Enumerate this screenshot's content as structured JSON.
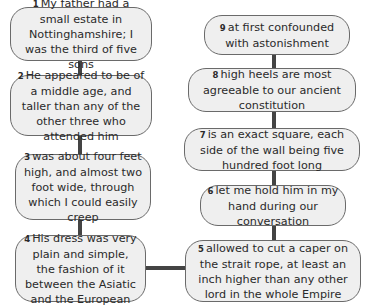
{
  "diagram": {
    "type": "flowchart",
    "colors": {
      "box_fill": "#efefef",
      "box_border": "#6a6a6a",
      "connector": "#444444",
      "text": "#2a2a2a"
    },
    "nodes": [
      {
        "num": "1",
        "text": "My father had a small estate in Nottinghamshire; I was the third of five sons"
      },
      {
        "num": "2",
        "text": "He appeared to be of a middle age, and taller than any of the other three who attended him"
      },
      {
        "num": "3",
        "text": "was about four feet high, and almost two foot wide, through which I could easily creep"
      },
      {
        "num": "4",
        "text": "His dress was very plain and simple, the fashion of it between the Asiatic and the European"
      },
      {
        "num": "5",
        "text": "allowed to cut a caper on the strait rope, at least an inch higher than any other lord in the whole Empire"
      },
      {
        "num": "6",
        "text": "let me hold him in my hand during our conversation"
      },
      {
        "num": "7",
        "text": "is an exact square, each side of the wall being five hundred foot long"
      },
      {
        "num": "8",
        "text": "high heels are most agreeable to our ancient constitution"
      },
      {
        "num": "9",
        "text": "at first confounded with astonishment"
      }
    ],
    "edges": [
      [
        "1",
        "2"
      ],
      [
        "2",
        "3"
      ],
      [
        "3",
        "4"
      ],
      [
        "4",
        "5"
      ],
      [
        "5",
        "6"
      ],
      [
        "6",
        "7"
      ],
      [
        "7",
        "8"
      ],
      [
        "8",
        "9"
      ]
    ]
  }
}
